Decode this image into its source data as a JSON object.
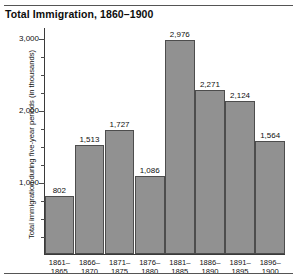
{
  "chart_data": {
    "type": "bar",
    "title": "Total Immigration, 1860–1900",
    "xlabel": "",
    "ylabel": "Total immigration during five-year periods (in thousands)",
    "categories": [
      "1861–1865",
      "1866–1870",
      "1871–1875",
      "1876–1880",
      "1881–1885",
      "1886–1890",
      "1891–1895",
      "1896–1900"
    ],
    "values": [
      802,
      1513,
      1727,
      1086,
      2976,
      2271,
      2124,
      1564
    ],
    "value_labels": [
      "802",
      "1,513",
      "1,727",
      "1,086",
      "2,976",
      "2,271",
      "2,124",
      "1,564"
    ],
    "ylim": [
      0,
      3150
    ],
    "ytick_major_values": [
      1000,
      2000,
      3000
    ],
    "ytick_major_labels": [
      "1,000",
      "2,000",
      "3,000"
    ],
    "ytick_minor_values": [
      250,
      500,
      750,
      1250,
      1500,
      1750,
      2250,
      2500,
      2750,
      3000
    ],
    "grid": false,
    "legend": null,
    "bar_color": "#919191",
    "bar_edge_color": "#4d4d4d",
    "axis_color": "#3a3a3a",
    "background_color": "#ffffff"
  }
}
